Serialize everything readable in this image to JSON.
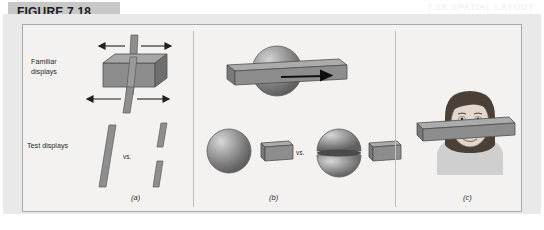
{
  "figure": {
    "label": "FIGURE 7.18",
    "ghost_text": "7.1K SPATIAL LAYOUT"
  },
  "row_labels": {
    "familiar": "Familiar\ndisplays",
    "test": "Test displays"
  },
  "comparison_word": "vs.",
  "panels": [
    {
      "id": "a",
      "label": "(a)",
      "familiar_object": "box-with-rod",
      "test_left": "single-tilted-rod",
      "test_right": "two-rod-segments"
    },
    {
      "id": "b",
      "label": "(b)",
      "familiar_object": "sphere-with-plate",
      "test_left": "sphere-and-plate",
      "test_right": "split-sphere-and-plate"
    },
    {
      "id": "c",
      "label": "(c)",
      "familiar_object": "face-with-plate"
    }
  ],
  "colors": {
    "band": "#c8c8c8",
    "frame_border": "#a9a9a9",
    "frame_bg": "#f3f2f0",
    "outer_bg": "#e9e9e9",
    "object_gray": "#8a8a8a",
    "arrow": "#1f1f1f"
  }
}
